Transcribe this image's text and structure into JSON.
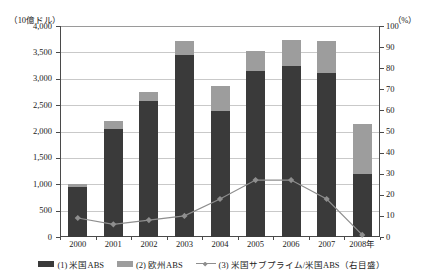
{
  "axes": {
    "left_unit": "（10億ドル）",
    "right_unit": "（%）",
    "left_ticks": [
      "4,000",
      "3,500",
      "3,000",
      "2,500",
      "2,000",
      "1,500",
      "1,000",
      "500",
      "0"
    ],
    "right_ticks": [
      "100",
      "90",
      "80",
      "70",
      "60",
      "50",
      "40",
      "30",
      "20",
      "10",
      "0"
    ],
    "x_ticks": [
      "2000",
      "2001",
      "2002",
      "2003",
      "2004",
      "2005",
      "2006",
      "2007",
      "2008年"
    ]
  },
  "legend": {
    "items": [
      {
        "label": "(1) 米国ABS",
        "color": "#3a3a3a",
        "marker": "square"
      },
      {
        "label": "(2) 欧州ABS",
        "color": "#9d9d9d",
        "marker": "square"
      },
      {
        "label": "(3) 米国サブプライム/米国ABS（右目盛）",
        "color": "#8e8e8e",
        "marker": "line-diamond"
      }
    ]
  },
  "chart_data": {
    "type": "bar",
    "title": "",
    "xlabel": "",
    "ylabel": "（10億ドル）",
    "y2label": "（%）",
    "ylim": [
      0,
      4000
    ],
    "y2lim": [
      0,
      100
    ],
    "ytick_step": 500,
    "y2tick_step": 10,
    "grid": true,
    "stacked": true,
    "legend_position": "bottom",
    "categories": [
      "2000",
      "2001",
      "2002",
      "2003",
      "2004",
      "2005",
      "2006",
      "2007",
      "2008年"
    ],
    "series": [
      {
        "name": "(1) 米国ABS",
        "type": "bar",
        "axis": "left",
        "color": "#3a3a3a",
        "values": [
          950,
          2050,
          2580,
          3450,
          2380,
          3140,
          3250,
          3110,
          1200
        ]
      },
      {
        "name": "(2) 欧州ABS",
        "type": "bar",
        "axis": "left",
        "color": "#9d9d9d",
        "values": [
          60,
          150,
          160,
          260,
          480,
          390,
          490,
          610,
          950
        ]
      },
      {
        "name": "(3) 米国サブプライム/米国ABS（右目盛）",
        "type": "line",
        "axis": "right",
        "color": "#8e8e8e",
        "values": [
          9,
          6,
          8,
          10,
          18,
          27,
          27,
          18,
          1
        ]
      }
    ],
    "totals": [
      1010,
      2200,
      2740,
      3710,
      2860,
      3530,
      3740,
      3720,
      2150
    ]
  }
}
